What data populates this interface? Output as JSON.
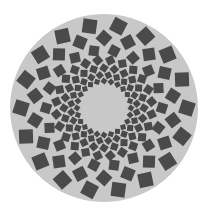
{
  "figure": {
    "background_color": "#ffffff",
    "disc": {
      "cx": 104,
      "cy": 108,
      "r": 94,
      "fill": "#c8c8c8"
    },
    "square_color": "#4a4a4a",
    "rings": [
      {
        "radius": 27,
        "count": 24,
        "size": 5,
        "rotation": 45,
        "offset": 0
      },
      {
        "radius": 33,
        "count": 24,
        "size": 6,
        "rotation": 45,
        "offset": 7.5
      },
      {
        "radius": 40,
        "count": 24,
        "size": 7,
        "rotation": 45,
        "offset": 0
      },
      {
        "radius": 48,
        "count": 24,
        "size": 8,
        "rotation": 45,
        "offset": 7.5
      },
      {
        "radius": 58,
        "count": 18,
        "size": 10,
        "rotation": 30,
        "offset": 0
      },
      {
        "radius": 70,
        "count": 18,
        "size": 12,
        "rotation": 30,
        "offset": 10
      },
      {
        "radius": 83,
        "count": 18,
        "size": 14,
        "rotation": 30,
        "offset": 0
      }
    ]
  }
}
